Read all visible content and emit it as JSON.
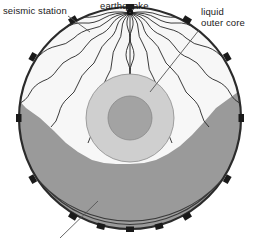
{
  "figure": {
    "background_color": "#ffffff",
    "width": 260,
    "height": 238
  },
  "labels": {
    "seismic_station": "seismic station",
    "earthquake": "earthquake",
    "liquid_outer_core_line1": "liquid",
    "liquid_outer_core_line2": "outer core"
  },
  "colors": {
    "outline": "#2b2b2b",
    "mantle_upper": "#f7f7f7",
    "shadow_zone_fill": "#9a9a9a",
    "outer_core_fill": "#cfcfcf",
    "inner_core_fill": "#a3a3a3",
    "station_marker": "#1a1a1a",
    "ray_stroke": "#262626",
    "arc_band": "#9e9e9e",
    "leader_line": "#555555",
    "text": "#1a1a1a"
  },
  "geometry": {
    "earth_center_x": 130,
    "earth_center_y": 118,
    "earth_radius": 112,
    "outer_core_center_x": 130,
    "outer_core_center_y": 118,
    "outer_core_radius": 44,
    "inner_core_radius": 22,
    "earthquake_focus_x": 130,
    "earthquake_focus_y": 12,
    "shadow_band_inner_radius": 120,
    "shadow_band_outer_radius": 127
  },
  "elements": {
    "seismic_station_count": 14,
    "ray_count": 15,
    "ray_style": "wavy"
  },
  "leader_lines": [
    {
      "name": "seismic-station-leader",
      "x1": 68,
      "y1": 15,
      "x2": 92,
      "y2": 32
    },
    {
      "name": "earthquake-leader",
      "x1": 130,
      "y1": 12,
      "x2": 130,
      "y2": 13
    },
    {
      "name": "liquid-outer-core-leader",
      "x1": 198,
      "y1": 30,
      "x2": 150,
      "y2": 92
    },
    {
      "name": "shadow-zone-leader",
      "x1": 62,
      "y1": 238,
      "x2": 96,
      "y2": 203
    }
  ]
}
